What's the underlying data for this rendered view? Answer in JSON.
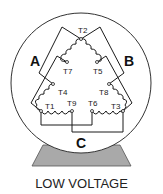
{
  "diagram": {
    "title": "LOW VOLTAGE",
    "phases": {
      "a": "A",
      "b": "B",
      "c": "C"
    },
    "terminals": {
      "t1": "T1",
      "t2": "T2",
      "t3": "T3",
      "t4": "T4",
      "t5": "T5",
      "t6": "T6",
      "t7": "T7",
      "t8": "T8",
      "t9": "T9"
    },
    "colors": {
      "line": "#1a1a1a",
      "base_fill": "#a9a9a9",
      "circle_stroke": "#333333",
      "background": "#ffffff"
    }
  }
}
